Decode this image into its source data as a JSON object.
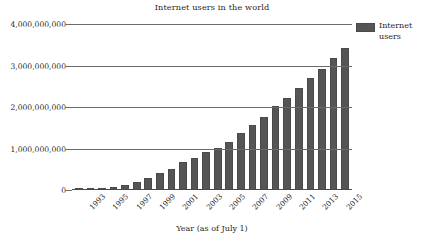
{
  "chart_data": {
    "type": "bar",
    "title": "Internet users in the world",
    "xlabel": "Year (as of July 1)",
    "ylabel": "",
    "ylim": [
      0,
      4000000000
    ],
    "grid": true,
    "legend_position": "right",
    "series": [
      {
        "name": "Internet users",
        "values": [
          14161570,
          25454590,
          44838900,
          77433860,
          120758310,
          188023930,
          280866670,
          413425190,
          502292080,
          665065014,
          781435983,
          913327771,
          1018057389,
          1162916818,
          1373040000,
          1562067594,
          1752333178,
          2023202974,
          2206051810,
          2458511490,
          2692999913,
          2925249355,
          3174705382,
          3424971237
        ]
      }
    ],
    "categories": [
      "1993",
      "1994",
      "1995",
      "1996",
      "1997",
      "1998",
      "1999",
      "2000",
      "2001",
      "2002",
      "2003",
      "2004",
      "2005",
      "2006",
      "2007",
      "2008",
      "2009",
      "2010",
      "2011",
      "2012",
      "2013",
      "2014",
      "2015",
      "2016"
    ],
    "xtick_labels": [
      "1993",
      "1995",
      "1997",
      "1999",
      "2001",
      "2003",
      "2005",
      "2007",
      "2009",
      "2011",
      "2013",
      "2015"
    ],
    "ytick_labels": [
      "0",
      "1,000,000,000",
      "2,000,000,000",
      "3,000,000,000",
      "4,000,000,000"
    ],
    "ytick_values": [
      0,
      1000000000,
      2000000000,
      3000000000,
      4000000000
    ],
    "bar_color": "#555555",
    "gridline_color": "#6b6b6b"
  },
  "legend": {
    "entries": [
      {
        "label": "Internet users",
        "color": "#555555"
      }
    ]
  }
}
